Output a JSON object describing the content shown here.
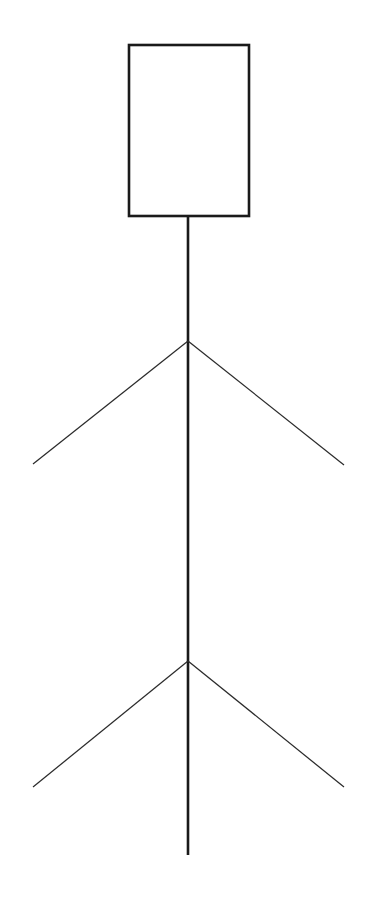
{
  "canvas": {
    "width": 373,
    "height": 915,
    "background_color": "#ffffff",
    "stroke_color_thick": "#1a1a1a",
    "stroke_color_thin": "#2b2b2b",
    "stroke_width_thick": 2.6,
    "stroke_width_thin": 1.25
  },
  "drawing": {
    "type": "line-drawing",
    "subject": "stick-figure",
    "description": "Minimal black-on-white line drawing: an empty upright rectangle at the top, a long vertical line descending from its bottom edge, with two downward-pointing V branches crossing the vertical line at upper and lower positions."
  },
  "shapes": {
    "head_box": {
      "name": "rectangle",
      "x": 129,
      "y": 45,
      "width": 120,
      "height": 171,
      "fill": "#ffffff",
      "stroke": "#1a1a1a",
      "stroke_width": 2.6
    },
    "spine": {
      "name": "vertical-line",
      "x1": 188,
      "y1": 216,
      "x2": 188,
      "y2": 855,
      "stroke": "#1a1a1a",
      "stroke_width": 2.6
    },
    "arms": {
      "name": "upper-v-branch",
      "apex_x": 188,
      "apex_y": 341,
      "left_end_x": 33,
      "left_end_y": 464,
      "right_end_x": 344,
      "right_end_y": 465,
      "stroke": "#2b2b2b",
      "stroke_width": 1.25
    },
    "legs": {
      "name": "lower-v-branch",
      "apex_x": 188,
      "apex_y": 661,
      "left_end_x": 33,
      "left_end_y": 787,
      "right_end_x": 344,
      "right_end_y": 787,
      "stroke": "#2b2b2b",
      "stroke_width": 1.25
    }
  }
}
